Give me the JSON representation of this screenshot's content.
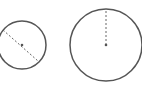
{
  "diagram": {
    "colors": {
      "stroke": "#555555",
      "dash": "#666666",
      "background": "#ffffff"
    },
    "circles": [
      {
        "name": "small-circle",
        "cx": 22,
        "cy": 45,
        "r": 24,
        "line": "diameter",
        "x1": 3,
        "y1": 30,
        "x2": 38,
        "y2": 61
      },
      {
        "name": "large-circle",
        "cx": 106,
        "cy": 45,
        "r": 36,
        "line": "radius",
        "x1": 106,
        "y1": 45,
        "x2": 106,
        "y2": 9
      }
    ]
  }
}
